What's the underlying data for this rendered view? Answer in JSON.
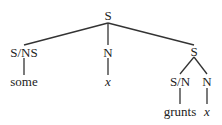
{
  "tree": {
    "root": {
      "label": "S"
    },
    "left": {
      "label": "S/NS",
      "leaf": "some"
    },
    "middle": {
      "label": "N",
      "leaf": "x"
    },
    "right": {
      "label": "S",
      "left": {
        "label": "S/N",
        "leaf": "grunts"
      },
      "right": {
        "label": "N",
        "leaf": "x"
      }
    }
  }
}
